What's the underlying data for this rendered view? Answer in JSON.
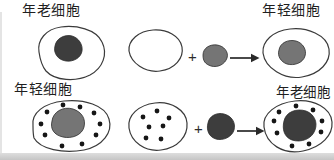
{
  "figure": {
    "type": "diagram",
    "colors": {
      "background": "#ffffff",
      "outline": "#3a3a3a",
      "old_nucleus": "#3d3d3d",
      "young_nucleus": "#757575",
      "dot": "#161616",
      "text": "#1f1f1f"
    },
    "dot_radius": 2.4,
    "labels": {
      "top_left": "年老细胞",
      "top_right": "年轻细胞",
      "bottom_left": "年轻细胞",
      "bottom_right": "年老细胞"
    },
    "operators": {
      "plus": "+"
    },
    "dots": {
      "young_cell": [
        [
          47,
          112
        ],
        [
          63,
          105
        ],
        [
          80,
          107
        ],
        [
          94,
          113
        ],
        [
          100,
          124
        ],
        [
          96,
          135
        ],
        [
          82,
          144
        ],
        [
          62,
          146
        ],
        [
          41,
          124
        ],
        [
          45,
          135
        ]
      ],
      "enucleated_young": [
        [
          143,
          117
        ],
        [
          157,
          111
        ],
        [
          169,
          118
        ],
        [
          149,
          127
        ],
        [
          163,
          126
        ],
        [
          146,
          138
        ],
        [
          161,
          139
        ]
      ],
      "result_old_cell": [
        [
          274,
          121
        ],
        [
          279,
          112
        ],
        [
          296,
          106
        ],
        [
          313,
          110
        ],
        [
          322,
          121
        ],
        [
          321,
          132
        ],
        [
          309,
          144
        ],
        [
          292,
          146
        ],
        [
          277,
          133
        ]
      ]
    }
  }
}
